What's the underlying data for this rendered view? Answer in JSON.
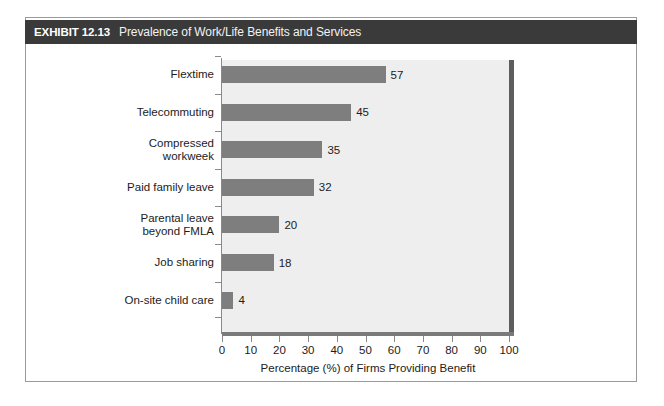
{
  "exhibit": {
    "label": "EXHIBIT 12.13",
    "title": "Prevalence of Work/Life Benefits and Services"
  },
  "colors": {
    "header_band": "#3a3a3a",
    "bar_fill": "#7e7e7e",
    "plot_background": "#eeeeee",
    "axis_line": "#7a7a7a",
    "side_wall": "#5d5d5d",
    "page_background": "#ffffff"
  },
  "chart_data": {
    "type": "bar",
    "orientation": "horizontal",
    "title": "Prevalence of Work/Life Benefits and Services",
    "categories": [
      "Flextime",
      "Telecommuting",
      "Compressed\nworkweek",
      "Paid family leave",
      "Parental leave\nbeyond FMLA",
      "Job sharing",
      "On-site child care"
    ],
    "values": [
      57,
      45,
      35,
      32,
      20,
      18,
      4
    ],
    "data_labels": [
      "57",
      "45",
      "35",
      "32",
      "20",
      "18",
      "4"
    ],
    "xlabel": "Percentage (%) of Firms Providing Benefit",
    "ylabel": "",
    "xlim": [
      0,
      100
    ],
    "xticks": [
      0,
      10,
      20,
      30,
      40,
      50,
      60,
      70,
      80,
      90,
      100
    ],
    "xtick_labels": [
      "0",
      "10",
      "20",
      "30",
      "40",
      "50",
      "60",
      "70",
      "80",
      "90",
      "100"
    ],
    "grid": false,
    "legend": false
  }
}
